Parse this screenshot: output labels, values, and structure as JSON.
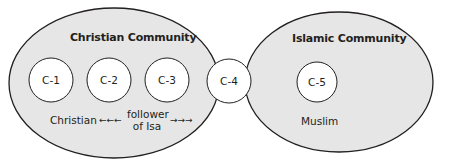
{
  "colors": {
    "community_fill": "#e6e6e6",
    "circle_fill": "#ffffff",
    "stroke": "#231f20",
    "text": "#231f20"
  },
  "communities": [
    {
      "id": "christian",
      "label": "Christian Community",
      "cx": 114,
      "cy": 83,
      "rx": 105,
      "ry": 75
    },
    {
      "id": "islamic",
      "label": "Islamic Community",
      "cx": 339,
      "cy": 82,
      "rx": 94,
      "ry": 70
    }
  ],
  "nodes": [
    {
      "label": "C-1",
      "cx": 51,
      "cy": 80,
      "r": 22
    },
    {
      "label": "C-2",
      "cx": 109,
      "cy": 80,
      "r": 22
    },
    {
      "label": "C-3",
      "cx": 167,
      "cy": 80,
      "r": 22
    },
    {
      "label": "C-4",
      "cx": 229,
      "cy": 81,
      "r": 22
    },
    {
      "label": "C-5",
      "cx": 317,
      "cy": 82,
      "r": 20
    }
  ],
  "identity_labels": {
    "christian": "Christian",
    "left_arrows": "←←←",
    "follower_line1": "follower",
    "follower_line2": "of Isa",
    "right_arrows": "→→→",
    "muslim": "Muslim"
  }
}
